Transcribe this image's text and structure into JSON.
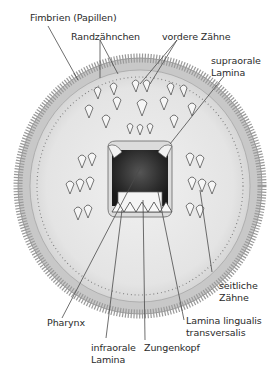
{
  "figure": {
    "colors": {
      "background": "#ffffff",
      "disc": "#e9e9e9",
      "fringe": "#bdbdbd",
      "pharynx": "#2b2b2b",
      "tooth": "#f4f4f4",
      "line": "#4a4a4a",
      "text": "#2a2a2a"
    }
  },
  "labels": {
    "fimbrien": "Fimbrien (Papillen)",
    "randzaehnchen": "Randzähnchen",
    "vordere_zaehne": "vordere Zähne",
    "supraorale_lamina": "supraorale\nLamina",
    "seitliche_zaehne": "seitliche\nZähne",
    "pharynx": "Pharynx",
    "lamina_lingualis": "Lamina lingualis\ntransversalis",
    "infraorale_lamina": "infraorale\nLamina",
    "zungenkopf": "Zungenkopf"
  }
}
